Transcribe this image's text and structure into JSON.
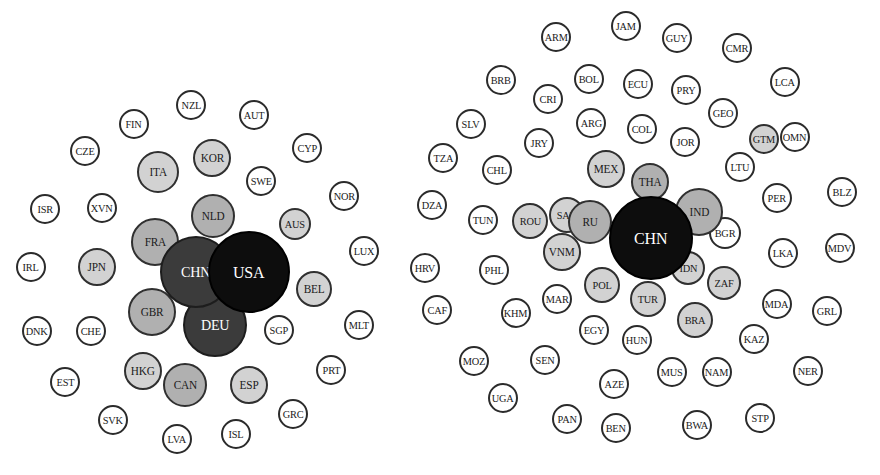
{
  "figure": {
    "type": "bubble-cluster-map",
    "title": "",
    "background_color": "#ffffff",
    "bottom_cutoff_text": "— —  —— — —  ——— — — ——  — —— ——",
    "palette": {
      "black": "#0d0d0d",
      "dark_gray": "#3b3b3b",
      "medium_gray": "#b0b0b0",
      "light_gray": "#d2d2d2",
      "white": "#ffffff",
      "outline": "#2b2b2b"
    },
    "size_tiers": {
      "black": "largest hub nodes",
      "dark_gray": "very large nodes",
      "medium_gray": "large nodes",
      "light_gray": "medium nodes",
      "white": "small nodes"
    }
  },
  "chart_data": {
    "type": "scatter",
    "title": "",
    "xlabel": "",
    "ylabel": "",
    "grid": false,
    "legend": "none",
    "clusters": [
      {
        "name": "left-cluster",
        "hub": "USA",
        "nodes": [
          {
            "label": "USA",
            "x": 249,
            "y": 272,
            "r": 41,
            "tier": "black",
            "font": 17
          },
          {
            "label": "CHN",
            "x": 196,
            "y": 272,
            "r": 36,
            "tier": "dgray",
            "font": 15
          },
          {
            "label": "DEU",
            "x": 215,
            "y": 325,
            "r": 32,
            "tier": "dgray",
            "font": 15
          },
          {
            "label": "FRA",
            "x": 155,
            "y": 242,
            "r": 24,
            "tier": "mgray",
            "font": 12
          },
          {
            "label": "GBR",
            "x": 152,
            "y": 312,
            "r": 24,
            "tier": "mgray",
            "font": 12
          },
          {
            "label": "NLD",
            "x": 213,
            "y": 216,
            "r": 22,
            "tier": "mgray",
            "font": 12
          },
          {
            "label": "CAN",
            "x": 185,
            "y": 385,
            "r": 22,
            "tier": "mgray",
            "font": 12
          },
          {
            "label": "ITA",
            "x": 158,
            "y": 172,
            "r": 21,
            "tier": "lgray",
            "font": 12
          },
          {
            "label": "JPN",
            "x": 97,
            "y": 267,
            "r": 19,
            "tier": "lgray",
            "font": 12
          },
          {
            "label": "KOR",
            "x": 212,
            "y": 158,
            "r": 19,
            "tier": "lgray",
            "font": 12
          },
          {
            "label": "HKG",
            "x": 143,
            "y": 371,
            "r": 19,
            "tier": "lgray",
            "font": 12
          },
          {
            "label": "ESP",
            "x": 249,
            "y": 385,
            "r": 19,
            "tier": "lgray",
            "font": 12
          },
          {
            "label": "BEL",
            "x": 314,
            "y": 289,
            "r": 18,
            "tier": "lgray",
            "font": 12
          },
          {
            "label": "AUS",
            "x": 295,
            "y": 224,
            "r": 16,
            "tier": "lgray",
            "font": 11
          },
          {
            "label": "SGP",
            "x": 279,
            "y": 330,
            "r": 15,
            "tier": "white",
            "font": 11
          },
          {
            "label": "SWE",
            "x": 261,
            "y": 181,
            "r": 15,
            "tier": "white",
            "font": 11
          },
          {
            "label": "CHE",
            "x": 91,
            "y": 331,
            "r": 15,
            "tier": "white",
            "font": 11
          },
          {
            "label": "CZE",
            "x": 85,
            "y": 151,
            "r": 15,
            "tier": "white",
            "font": 11
          },
          {
            "label": "AUT",
            "x": 254,
            "y": 115,
            "r": 15,
            "tier": "white",
            "font": 11
          },
          {
            "label": "FIN",
            "x": 134,
            "y": 124,
            "r": 15,
            "tier": "white",
            "font": 11
          },
          {
            "label": "NZL",
            "x": 191,
            "y": 105,
            "r": 15,
            "tier": "white",
            "font": 11
          },
          {
            "label": "CYP",
            "x": 307,
            "y": 148,
            "r": 15,
            "tier": "white",
            "font": 11
          },
          {
            "label": "NOR",
            "x": 344,
            "y": 196,
            "r": 15,
            "tier": "white",
            "font": 11
          },
          {
            "label": "LUX",
            "x": 364,
            "y": 251,
            "r": 15,
            "tier": "white",
            "font": 11
          },
          {
            "label": "MLT",
            "x": 359,
            "y": 325,
            "r": 15,
            "tier": "white",
            "font": 11
          },
          {
            "label": "PRT",
            "x": 331,
            "y": 370,
            "r": 15,
            "tier": "white",
            "font": 11
          },
          {
            "label": "GRC",
            "x": 293,
            "y": 414,
            "r": 15,
            "tier": "white",
            "font": 11
          },
          {
            "label": "ISL",
            "x": 236,
            "y": 434,
            "r": 15,
            "tier": "white",
            "font": 11
          },
          {
            "label": "LVA",
            "x": 177,
            "y": 439,
            "r": 15,
            "tier": "white",
            "font": 11
          },
          {
            "label": "SVK",
            "x": 113,
            "y": 420,
            "r": 15,
            "tier": "white",
            "font": 11
          },
          {
            "label": "EST",
            "x": 65,
            "y": 382,
            "r": 15,
            "tier": "white",
            "font": 11
          },
          {
            "label": "DNK",
            "x": 37,
            "y": 331,
            "r": 15,
            "tier": "white",
            "font": 11
          },
          {
            "label": "IRL",
            "x": 31,
            "y": 267,
            "r": 15,
            "tier": "white",
            "font": 11
          },
          {
            "label": "ISR",
            "x": 45,
            "y": 209,
            "r": 15,
            "tier": "white",
            "font": 11
          },
          {
            "label": "XVN",
            "x": 102,
            "y": 208,
            "r": 15,
            "tier": "white",
            "font": 11
          }
        ]
      },
      {
        "name": "right-cluster",
        "hub": "CHN",
        "nodes": [
          {
            "label": "CHN",
            "x": 651,
            "y": 238,
            "r": 42,
            "tier": "black",
            "font": 17
          },
          {
            "label": "IND",
            "x": 699,
            "y": 212,
            "r": 24,
            "tier": "mgray",
            "font": 12
          },
          {
            "label": "RU",
            "x": 590,
            "y": 222,
            "r": 22,
            "tier": "mgray",
            "font": 12
          },
          {
            "label": "THA",
            "x": 650,
            "y": 182,
            "r": 19,
            "tier": "mgray",
            "font": 12
          },
          {
            "label": "MEX",
            "x": 606,
            "y": 169,
            "r": 19,
            "tier": "lgray",
            "font": 12
          },
          {
            "label": "VNM",
            "x": 562,
            "y": 252,
            "r": 19,
            "tier": "lgray",
            "font": 12
          },
          {
            "label": "SAU",
            "x": 567,
            "y": 215,
            "r": 18,
            "tier": "lgray",
            "font": 11
          },
          {
            "label": "ROU",
            "x": 530,
            "y": 221,
            "r": 18,
            "tier": "lgray",
            "font": 11
          },
          {
            "label": "POL",
            "x": 602,
            "y": 285,
            "r": 18,
            "tier": "lgray",
            "font": 11
          },
          {
            "label": "TUR",
            "x": 648,
            "y": 299,
            "r": 18,
            "tier": "lgray",
            "font": 11
          },
          {
            "label": "BRA",
            "x": 695,
            "y": 320,
            "r": 18,
            "tier": "lgray",
            "font": 11
          },
          {
            "label": "IDN",
            "x": 688,
            "y": 268,
            "r": 17,
            "tier": "lgray",
            "font": 11
          },
          {
            "label": "ZAF",
            "x": 724,
            "y": 283,
            "r": 17,
            "tier": "lgray",
            "font": 11
          },
          {
            "label": "BGR",
            "x": 725,
            "y": 233,
            "r": 16,
            "tier": "white",
            "font": 11
          },
          {
            "label": "GTM",
            "x": 764,
            "y": 139,
            "r": 15,
            "tier": "lgray",
            "font": 11
          },
          {
            "label": "ARM",
            "x": 556,
            "y": 37,
            "r": 15,
            "tier": "white",
            "font": 11
          },
          {
            "label": "JAM",
            "x": 626,
            "y": 26,
            "r": 15,
            "tier": "white",
            "font": 11
          },
          {
            "label": "GUY",
            "x": 677,
            "y": 38,
            "r": 15,
            "tier": "white",
            "font": 11
          },
          {
            "label": "CMR",
            "x": 737,
            "y": 48,
            "r": 15,
            "tier": "white",
            "font": 11
          },
          {
            "label": "BRB",
            "x": 501,
            "y": 80,
            "r": 15,
            "tier": "white",
            "font": 11
          },
          {
            "label": "BOL",
            "x": 589,
            "y": 79,
            "r": 15,
            "tier": "white",
            "font": 11
          },
          {
            "label": "ECU",
            "x": 638,
            "y": 84,
            "r": 15,
            "tier": "white",
            "font": 11
          },
          {
            "label": "PRY",
            "x": 686,
            "y": 90,
            "r": 15,
            "tier": "white",
            "font": 11
          },
          {
            "label": "LCA",
            "x": 785,
            "y": 82,
            "r": 15,
            "tier": "white",
            "font": 11
          },
          {
            "label": "CRI",
            "x": 548,
            "y": 99,
            "r": 15,
            "tier": "white",
            "font": 11
          },
          {
            "label": "SLV",
            "x": 471,
            "y": 124,
            "r": 15,
            "tier": "white",
            "font": 11
          },
          {
            "label": "ARG",
            "x": 591,
            "y": 123,
            "r": 15,
            "tier": "white",
            "font": 11
          },
          {
            "label": "COL",
            "x": 642,
            "y": 129,
            "r": 15,
            "tier": "white",
            "font": 11
          },
          {
            "label": "GEO",
            "x": 723,
            "y": 113,
            "r": 15,
            "tier": "white",
            "font": 11
          },
          {
            "label": "JOR",
            "x": 685,
            "y": 142,
            "r": 15,
            "tier": "white",
            "font": 11
          },
          {
            "label": "OMN",
            "x": 795,
            "y": 137,
            "r": 15,
            "tier": "white",
            "font": 11
          },
          {
            "label": "TZA",
            "x": 443,
            "y": 158,
            "r": 15,
            "tier": "white",
            "font": 11
          },
          {
            "label": "JRY",
            "x": 539,
            "y": 143,
            "r": 15,
            "tier": "white",
            "font": 11
          },
          {
            "label": "LTU",
            "x": 740,
            "y": 167,
            "r": 15,
            "tier": "white",
            "font": 11
          },
          {
            "label": "CHL",
            "x": 497,
            "y": 170,
            "r": 15,
            "tier": "white",
            "font": 11
          },
          {
            "label": "DZA",
            "x": 432,
            "y": 205,
            "r": 15,
            "tier": "white",
            "font": 11
          },
          {
            "label": "PER",
            "x": 777,
            "y": 198,
            "r": 15,
            "tier": "white",
            "font": 11
          },
          {
            "label": "BLZ",
            "x": 842,
            "y": 192,
            "r": 15,
            "tier": "white",
            "font": 11
          },
          {
            "label": "TUN",
            "x": 483,
            "y": 220,
            "r": 15,
            "tier": "white",
            "font": 11
          },
          {
            "label": "LKA",
            "x": 783,
            "y": 253,
            "r": 15,
            "tier": "white",
            "font": 11
          },
          {
            "label": "MDV",
            "x": 840,
            "y": 248,
            "r": 15,
            "tier": "white",
            "font": 11
          },
          {
            "label": "HRV",
            "x": 425,
            "y": 268,
            "r": 15,
            "tier": "white",
            "font": 11
          },
          {
            "label": "PHL",
            "x": 494,
            "y": 270,
            "r": 15,
            "tier": "white",
            "font": 11
          },
          {
            "label": "MAR",
            "x": 557,
            "y": 299,
            "r": 15,
            "tier": "white",
            "font": 11
          },
          {
            "label": "MDA",
            "x": 777,
            "y": 304,
            "r": 15,
            "tier": "white",
            "font": 11
          },
          {
            "label": "GRL",
            "x": 827,
            "y": 311,
            "r": 15,
            "tier": "white",
            "font": 11
          },
          {
            "label": "CAF",
            "x": 437,
            "y": 310,
            "r": 15,
            "tier": "white",
            "font": 11
          },
          {
            "label": "KHM",
            "x": 516,
            "y": 313,
            "r": 15,
            "tier": "white",
            "font": 11
          },
          {
            "label": "EGY",
            "x": 594,
            "y": 330,
            "r": 15,
            "tier": "white",
            "font": 11
          },
          {
            "label": "HUN",
            "x": 637,
            "y": 340,
            "r": 15,
            "tier": "white",
            "font": 11
          },
          {
            "label": "KAZ",
            "x": 754,
            "y": 339,
            "r": 15,
            "tier": "white",
            "font": 11
          },
          {
            "label": "MOZ",
            "x": 474,
            "y": 361,
            "r": 15,
            "tier": "white",
            "font": 11
          },
          {
            "label": "SEN",
            "x": 545,
            "y": 360,
            "r": 15,
            "tier": "white",
            "font": 11
          },
          {
            "label": "MUS",
            "x": 672,
            "y": 372,
            "r": 15,
            "tier": "white",
            "font": 11
          },
          {
            "label": "NAM",
            "x": 717,
            "y": 372,
            "r": 15,
            "tier": "white",
            "font": 11
          },
          {
            "label": "NER",
            "x": 808,
            "y": 371,
            "r": 15,
            "tier": "white",
            "font": 11
          },
          {
            "label": "UGA",
            "x": 503,
            "y": 398,
            "r": 15,
            "tier": "white",
            "font": 11
          },
          {
            "label": "AZE",
            "x": 614,
            "y": 384,
            "r": 15,
            "tier": "white",
            "font": 11
          },
          {
            "label": "PAN",
            "x": 567,
            "y": 419,
            "r": 15,
            "tier": "white",
            "font": 11
          },
          {
            "label": "BEN",
            "x": 616,
            "y": 428,
            "r": 15,
            "tier": "white",
            "font": 11
          },
          {
            "label": "BWA",
            "x": 697,
            "y": 425,
            "r": 15,
            "tier": "white",
            "font": 11
          },
          {
            "label": "STP",
            "x": 760,
            "y": 418,
            "r": 15,
            "tier": "white",
            "font": 11
          }
        ]
      }
    ]
  }
}
